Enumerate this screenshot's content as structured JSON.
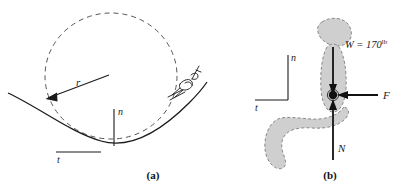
{
  "figure": {
    "panels": [
      {
        "id": "a",
        "caption": "(a)",
        "labels": {
          "radius": "r",
          "normal_axis": "n",
          "tangential_axis": "t"
        },
        "icons": {
          "skier": "skier-icon",
          "circle": "dashed-circle-icon",
          "slope": "slope-curve-icon",
          "radius_arrow": "radius-arrow-icon"
        }
      },
      {
        "id": "b",
        "caption": "(b)",
        "labels": {
          "normal_axis": "n",
          "tangential_axis": "t",
          "weight": "W = 170",
          "weight_unit": "lb",
          "friction_force": "F",
          "normal_force": "N"
        },
        "icons": {
          "body": "seated-person-icon",
          "weight_arrow": "weight-arrow-icon",
          "friction_arrow": "friction-arrow-icon",
          "normal_arrow": "normal-arrow-icon",
          "center_of_mass": "center-of-mass-dot-icon"
        }
      }
    ],
    "colors": {
      "ink": "#1a1a1a",
      "body_fill": "#cfcfcf",
      "body_stroke": "#8a8a8a",
      "dashed": "#555555"
    }
  }
}
